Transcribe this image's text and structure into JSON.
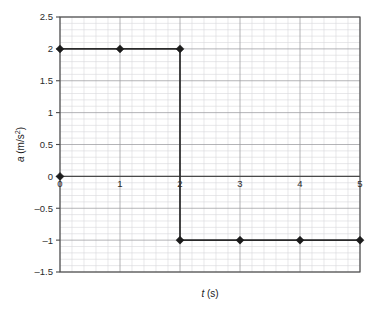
{
  "chart_data": {
    "type": "line",
    "title": "",
    "subtitle": "",
    "xlabel": "t (s)",
    "xlabel_symbol": "t",
    "xlabel_unit": "(s)",
    "ylabel": "a (m/s²)",
    "ylabel_symbol": "a",
    "ylabel_unit": "(m/s²)",
    "xlim": [
      0,
      5
    ],
    "ylim": [
      -1.5,
      2.5
    ],
    "xticks": [
      0,
      1,
      2,
      3,
      4,
      5
    ],
    "xtick_labels": [
      "0",
      "1",
      "2",
      "3",
      "4",
      "5"
    ],
    "yticks": [
      2.5,
      2,
      1.5,
      1,
      0.5,
      0,
      -0.5,
      -1,
      -1.5
    ],
    "ytick_labels": [
      "2.5",
      "2",
      "1.5",
      "1",
      "0.5",
      "0",
      "–0.5",
      "–1",
      "–1.5"
    ],
    "grid": true,
    "minor_grid": true,
    "minor_divisions_x": 5,
    "minor_divisions_y": 5,
    "legend": false,
    "legend_position": "none",
    "zero_line": true,
    "marker_shape": "diamond",
    "series": [
      {
        "name": "acceleration",
        "color": "#1c1c1c",
        "points": [
          {
            "x": 0,
            "y": 2
          },
          {
            "x": 1,
            "y": 2
          },
          {
            "x": 2,
            "y": 2
          },
          {
            "x": 2,
            "y": -1
          },
          {
            "x": 3,
            "y": -1
          },
          {
            "x": 4,
            "y": -1
          },
          {
            "x": 5,
            "y": -1
          }
        ],
        "markers": [
          {
            "x": 0,
            "y": 0
          },
          {
            "x": 0,
            "y": 2
          },
          {
            "x": 1,
            "y": 2
          },
          {
            "x": 2,
            "y": 2
          },
          {
            "x": 2,
            "y": -1
          },
          {
            "x": 3,
            "y": -1
          },
          {
            "x": 4,
            "y": -1
          },
          {
            "x": 5,
            "y": -1
          }
        ]
      }
    ]
  },
  "colors": {
    "background": "#ffffff",
    "minor_grid": "#d8d8dc",
    "major_grid": "#9b9b9f",
    "axis": "#4a4a4a",
    "series": "#1c1c1c",
    "text": "#2b2b2b"
  }
}
